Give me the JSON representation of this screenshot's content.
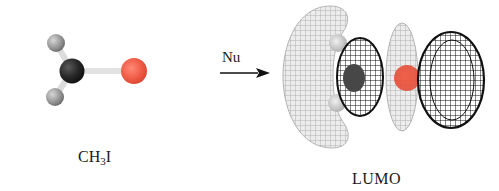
{
  "figure": {
    "molecule": {
      "formula_prefix": "CH",
      "formula_subscript": "3",
      "formula_suffix": "I",
      "atoms": [
        {
          "element": "H",
          "color": "#9a9a9a"
        },
        {
          "element": "C",
          "color": "#2a2a2a"
        },
        {
          "element": "H",
          "color": "#9a9a9a"
        },
        {
          "element": "I",
          "color": "#ee5a44"
        }
      ]
    },
    "reaction_arrow": {
      "label": "Nu",
      "direction": "right"
    },
    "orbital": {
      "label": "LUMO",
      "phase_colors": {
        "positive_mesh": "#b9b9b9",
        "negative_mesh": "#111111",
        "iodine": "#e8503a",
        "carbon": "#3c3c3c",
        "hydrogen": "#d5d5d5"
      }
    }
  }
}
